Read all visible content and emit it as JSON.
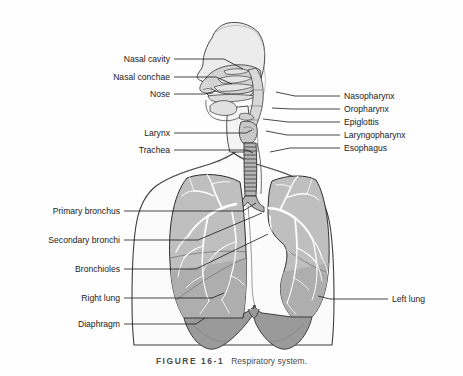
{
  "figure": {
    "number_label": "FIGURE  16-1",
    "title": "Respiratory system."
  },
  "colors": {
    "background": "#fefefe",
    "outline": "#3c3c3c",
    "body_fill": "#fbfbfb",
    "head_fill": "#ececec",
    "nasal_fill": "#d2d2d2",
    "lung_fill": "#bfbfbf",
    "lung_lower_fill": "#a8a8a8",
    "diaphragm_fill": "#9a9a9a",
    "bronchial_tree": "#ffffff",
    "trachea_fill": "#b4b4b4",
    "label_text": "#1a1a1a",
    "leader_line": "#1a1a1a",
    "caption_text": "#4a4a4a"
  },
  "labels_left": [
    {
      "id": "nasal-cavity",
      "text": "Nasal cavity",
      "text_x": 170,
      "text_y": 62,
      "points": "174,59 224,59 243,69"
    },
    {
      "id": "nasal-conchae",
      "text": "Nasal conchae",
      "text_x": 170,
      "text_y": 80,
      "points": "174,77 216,77 232,84"
    },
    {
      "id": "nose",
      "text": "Nose",
      "text_x": 170,
      "text_y": 97,
      "points": "174,94 205,94 216,91"
    },
    {
      "id": "larynx",
      "text": "Larynx",
      "text_x": 170,
      "text_y": 136,
      "points": "174,133 246,133 252,130"
    },
    {
      "id": "trachea",
      "text": "Trachea",
      "text_x": 170,
      "text_y": 153,
      "points": "174,150 247,150 253,153"
    },
    {
      "id": "primary-bronchus",
      "text": "Primary bronchus",
      "text_x": 120,
      "text_y": 214,
      "points": "124,211 243,211 256,203"
    },
    {
      "id": "secondary-bronchi",
      "text": "Secondary bronchi",
      "text_x": 120,
      "text_y": 243,
      "points": "124,240 198,240 262,213"
    },
    {
      "id": "bronchioles",
      "text": "Bronchioles",
      "text_x": 120,
      "text_y": 272,
      "points": "124,269 196,269 268,234"
    },
    {
      "id": "right-lung",
      "text": "Right lung",
      "text_x": 120,
      "text_y": 301,
      "points": "124,298 212,298 224,293"
    },
    {
      "id": "diaphragm",
      "text": "Diaphragm",
      "text_x": 120,
      "text_y": 327,
      "points": "124,324 196,324 205,318"
    }
  ],
  "labels_right": [
    {
      "id": "nasopharynx",
      "text": "Nasopharynx",
      "text_x": 344,
      "text_y": 99,
      "points": "340,96 295,96 276,92"
    },
    {
      "id": "oropharynx",
      "text": "Oropharynx",
      "text_x": 344,
      "text_y": 112,
      "points": "340,109 292,109 272,108"
    },
    {
      "id": "epiglottis",
      "text": "Epiglottis",
      "text_x": 344,
      "text_y": 125,
      "points": "340,122 288,122 263,119"
    },
    {
      "id": "laryngopharynx",
      "text": "Laryngopharynx",
      "text_x": 344,
      "text_y": 138,
      "points": "340,135 287,135 266,131"
    },
    {
      "id": "esophagus",
      "text": "Esophagus",
      "text_x": 344,
      "text_y": 151,
      "points": "340,148 290,148 270,152"
    },
    {
      "id": "left-lung",
      "text": "Left lung",
      "text_x": 392,
      "text_y": 302,
      "points": "388,299 330,299 318,296"
    }
  ]
}
